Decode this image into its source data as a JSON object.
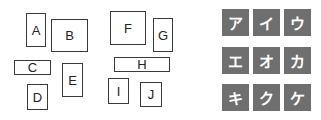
{
  "boxes": [
    {
      "label": "A",
      "x": 26,
      "y": 13,
      "w": 20,
      "h": 34
    },
    {
      "label": "B",
      "x": 51,
      "y": 19,
      "w": 37,
      "h": 33
    },
    {
      "label": "C",
      "x": 14,
      "y": 60,
      "w": 37,
      "h": 15
    },
    {
      "label": "D",
      "x": 27,
      "y": 84,
      "w": 21,
      "h": 26
    },
    {
      "label": "E",
      "x": 62,
      "y": 63,
      "w": 21,
      "h": 34
    },
    {
      "label": "F",
      "x": 110,
      "y": 11,
      "w": 36,
      "h": 34
    },
    {
      "label": "G",
      "x": 153,
      "y": 18,
      "w": 20,
      "h": 34
    },
    {
      "label": "H",
      "x": 114,
      "y": 57,
      "w": 56,
      "h": 15
    },
    {
      "label": "I",
      "x": 108,
      "y": 78,
      "w": 21,
      "h": 26
    },
    {
      "label": "J",
      "x": 140,
      "y": 82,
      "w": 22,
      "h": 25
    }
  ],
  "tiles": [
    {
      "label": "ア",
      "x": 222,
      "y": 9
    },
    {
      "label": "イ",
      "x": 253,
      "y": 9
    },
    {
      "label": "ウ",
      "x": 284,
      "y": 9
    },
    {
      "label": "エ",
      "x": 222,
      "y": 47
    },
    {
      "label": "オ",
      "x": 253,
      "y": 47
    },
    {
      "label": "カ",
      "x": 284,
      "y": 47
    },
    {
      "label": "キ",
      "x": 222,
      "y": 84
    },
    {
      "label": "ク",
      "x": 253,
      "y": 84
    },
    {
      "label": "ケ",
      "x": 284,
      "y": 84
    }
  ],
  "colors": {
    "tile": "#6f6f6f",
    "border": "#3a3a3a"
  }
}
